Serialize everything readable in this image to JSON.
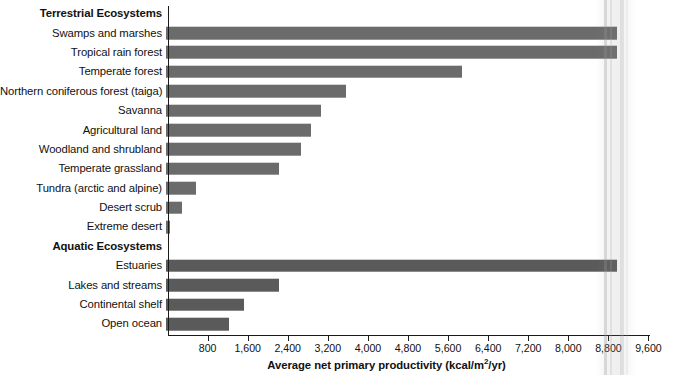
{
  "chart_data": {
    "type": "bar",
    "orientation": "horizontal",
    "title": "",
    "xlabel_text_before": "Average net primary productivity (kcal/m",
    "xlabel_sup": "2",
    "xlabel_text_after": "/yr)",
    "xlabel": "Average net primary productivity (kcal/m2/yr)",
    "ylabel": "",
    "xlim": [
      0,
      9600
    ],
    "tick_labels": [
      "800",
      "1,600",
      "2,400",
      "3,200",
      "4,000",
      "4,800",
      "5,600",
      "6,400",
      "7,200",
      "8,000",
      "8,800",
      "9,600"
    ],
    "tick_values": [
      800,
      1600,
      2400,
      3200,
      4000,
      4800,
      5600,
      6400,
      7200,
      8000,
      8800,
      9600
    ],
    "grid": false,
    "legend": "none",
    "groups": [
      {
        "name": "Terrestrial Ecosystems",
        "categories": [
          "Swamps and marshes",
          "Tropical rain forest",
          "Temperate forest",
          "Northern coniferous forest (taiga)",
          "Savanna",
          "Agricultural land",
          "Woodland and shrubland",
          "Temperate grassland",
          "Tundra (arctic and alpine)",
          "Desert scrub",
          "Extreme desert"
        ],
        "values": [
          9000,
          9000,
          5900,
          3600,
          3100,
          2900,
          2700,
          2250,
          600,
          320,
          80
        ]
      },
      {
        "name": "Aquatic Ecosystems",
        "categories": [
          "Estuaries",
          "Lakes and streams",
          "Continental shelf",
          "Open ocean"
        ],
        "values": [
          9000,
          2250,
          1550,
          1250
        ]
      }
    ]
  },
  "rows": [
    {
      "label": "Terrestrial Ecosystems",
      "kind": "group"
    },
    {
      "label": "Swamps and marshes",
      "kind": "bar",
      "value": 9000,
      "shade": "light"
    },
    {
      "label": "Tropical rain forest",
      "kind": "bar",
      "value": 9000,
      "shade": "light"
    },
    {
      "label": "Temperate forest",
      "kind": "bar",
      "value": 5900,
      "shade": "light"
    },
    {
      "label": "Northern coniferous forest (taiga)",
      "kind": "bar",
      "value": 3600,
      "shade": "light"
    },
    {
      "label": "Savanna",
      "kind": "bar",
      "value": 3100,
      "shade": "light"
    },
    {
      "label": "Agricultural land",
      "kind": "bar",
      "value": 2900,
      "shade": "light"
    },
    {
      "label": "Woodland and shrubland",
      "kind": "bar",
      "value": 2700,
      "shade": "light"
    },
    {
      "label": "Temperate grassland",
      "kind": "bar",
      "value": 2250,
      "shade": "light"
    },
    {
      "label": "Tundra (arctic and alpine)",
      "kind": "bar",
      "value": 600,
      "shade": "light"
    },
    {
      "label": "Desert scrub",
      "kind": "bar",
      "value": 320,
      "shade": "light"
    },
    {
      "label": "Extreme desert",
      "kind": "bar",
      "value": 80,
      "shade": "light"
    },
    {
      "label": "Aquatic Ecosystems",
      "kind": "group"
    },
    {
      "label": "Estuaries",
      "kind": "bar",
      "value": 9000,
      "shade": "dark"
    },
    {
      "label": "Lakes and streams",
      "kind": "bar",
      "value": 2250,
      "shade": "dark"
    },
    {
      "label": "Continental shelf",
      "kind": "bar",
      "value": 1550,
      "shade": "dark"
    },
    {
      "label": "Open ocean",
      "kind": "bar",
      "value": 1250,
      "shade": "dark"
    }
  ],
  "colors": {
    "bar_light": "#6b6b6b",
    "bar_dark": "#5a5a5a",
    "axis": "#1a1a1a",
    "text": "#111111",
    "background": "#ffffff"
  },
  "geometry": {
    "axis_origin_x": 167.5,
    "px_per_unit": 0.050104,
    "axis_top_y": 6,
    "axis_bottom_y": 335,
    "row_height": 19.4,
    "bar_height": 12.6
  }
}
